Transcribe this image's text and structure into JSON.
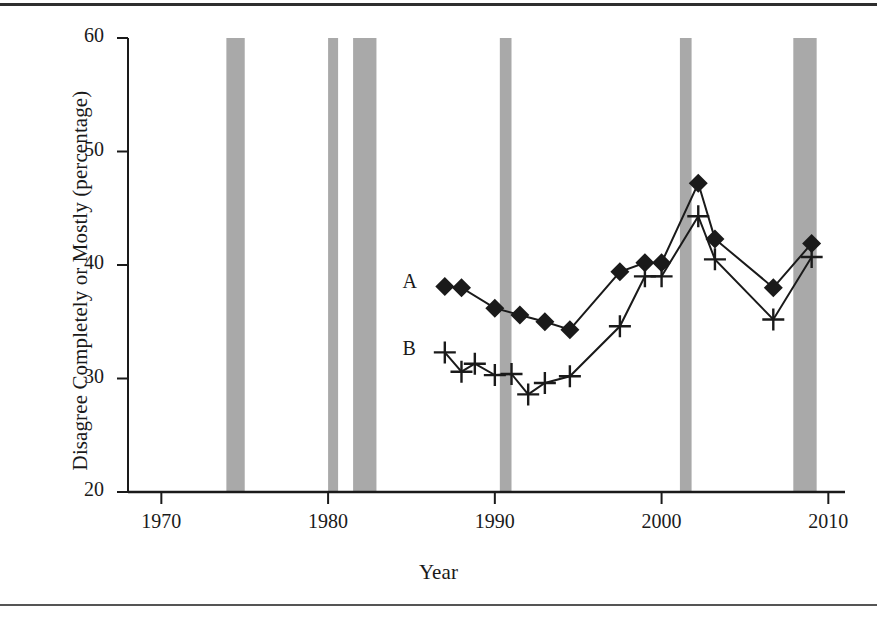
{
  "figure": {
    "background_color": "#ffffff",
    "rule_color": "#2e2e2e",
    "band_color": "#a9a9a9",
    "ink_color": "#1a1a1a"
  },
  "chart_data": {
    "type": "line",
    "title": "",
    "subtitle": "",
    "xlabel": "Year",
    "ylabel": "Disagree Completely or Mostly (percentage)",
    "xlim": [
      1968,
      2011
    ],
    "ylim": [
      20,
      60
    ],
    "xticks": [
      1970,
      1980,
      1990,
      2000,
      2010
    ],
    "xtick_labels": [
      "1970",
      "1980",
      "1990",
      "2000",
      "2010"
    ],
    "yticks": [
      20,
      30,
      40,
      50,
      60
    ],
    "ytick_labels": [
      "20",
      "30",
      "40",
      "50",
      "60"
    ],
    "grid": false,
    "legend_position": "inline-left",
    "series": [
      {
        "name": "A",
        "label": "A",
        "marker": "diamond",
        "x": [
          1987,
          1988,
          1990,
          1991.5,
          1993,
          1994.5,
          1997.5,
          1999,
          2000,
          2002.2,
          2003.2,
          2006.7,
          2009
        ],
        "values": [
          38.1,
          38.0,
          36.2,
          35.6,
          35.0,
          34.3,
          39.4,
          40.2,
          40.2,
          47.2,
          42.3,
          38.0,
          41.9
        ]
      },
      {
        "name": "B",
        "label": "B",
        "marker": "plus",
        "x": [
          1987,
          1988,
          1988.8,
          1990,
          1991,
          1992,
          1993,
          1994.5,
          1997.5,
          1999,
          2000,
          2002.2,
          2003.2,
          2006.7,
          2009
        ],
        "values": [
          32.3,
          30.6,
          31.3,
          30.3,
          30.4,
          28.6,
          29.6,
          30.2,
          34.6,
          39.0,
          39.0,
          44.3,
          40.5,
          35.2,
          40.7
        ]
      }
    ],
    "shaded_bands": [
      {
        "name": "recession-1973",
        "start": 1973.9,
        "end": 1975.0
      },
      {
        "name": "recession-1980",
        "start": 1980.0,
        "end": 1980.6
      },
      {
        "name": "recession-1981",
        "start": 1981.5,
        "end": 1982.9
      },
      {
        "name": "recession-1990",
        "start": 1990.3,
        "end": 1991.0
      },
      {
        "name": "recession-2001",
        "start": 2001.1,
        "end": 2001.8
      },
      {
        "name": "recession-2008",
        "start": 2007.9,
        "end": 2009.3
      }
    ],
    "annotations": [
      {
        "name": "series-a-label",
        "text": "A",
        "x": 1985.0,
        "y": 38.3
      },
      {
        "name": "series-b-label",
        "text": "B",
        "x": 1985.0,
        "y": 32.4
      }
    ]
  }
}
